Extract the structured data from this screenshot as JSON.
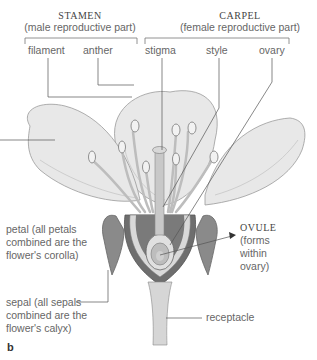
{
  "groups": {
    "stamen": {
      "title": "STAMEN",
      "subtitle": "(male reproductive part)"
    },
    "carpel": {
      "title": "CARPEL",
      "subtitle": "(female reproductive part)"
    }
  },
  "labels": {
    "filament": "filament",
    "anther": "anther",
    "stigma": "stigma",
    "style": "style",
    "ovary": "ovary",
    "ovule_title": "OVULE",
    "ovule_l1": "(forms",
    "ovule_l2": "within",
    "ovule_l3": "ovary)",
    "petal_l1": "petal (all petals",
    "petal_l2": "combined are the",
    "petal_l3": "flower's corolla)",
    "sepal_l1": "sepal (all sepals",
    "sepal_l2": "combined are the",
    "sepal_l3": "flower's calyx)",
    "receptacle": "receptacle"
  },
  "panel_letter": "b",
  "colors": {
    "line": "#555555",
    "petal_fill": "#e6e6e6",
    "petal_edge": "#999999",
    "dark": "#6e6e6e"
  }
}
